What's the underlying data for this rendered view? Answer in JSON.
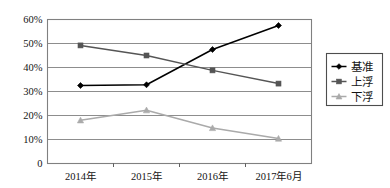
{
  "chart_data": {
    "type": "line",
    "title": "",
    "xlabel": "",
    "ylabel": "",
    "categories": [
      "2014年",
      "2015年",
      "2016年",
      "2017年6月"
    ],
    "series": [
      {
        "name": "基准",
        "values": [
          32.5,
          32.8,
          47.5,
          57.5
        ],
        "color": "#000000",
        "marker": "diamond"
      },
      {
        "name": "上浮",
        "values": [
          49.2,
          45.0,
          38.8,
          33.3
        ],
        "color": "#555555",
        "marker": "square"
      },
      {
        "name": "下浮",
        "values": [
          18.0,
          22.2,
          14.8,
          10.4
        ],
        "color": "#aaaaaa",
        "marker": "triangle"
      }
    ],
    "ylim": [
      0,
      60
    ],
    "ytick_values": [
      0,
      10,
      20,
      30,
      40,
      50,
      60
    ],
    "ytick_labels": [
      "0",
      "10%",
      "20%",
      "30%",
      "40%",
      "50%",
      "60%"
    ],
    "grid": true,
    "grid_axis": "y",
    "legend_position": "right",
    "legend_entries": [
      "基准",
      "上浮",
      "下浮"
    ],
    "plot_background": "#ffffff",
    "plot_border_color": "#808080",
    "gridline_color": "#808080"
  }
}
